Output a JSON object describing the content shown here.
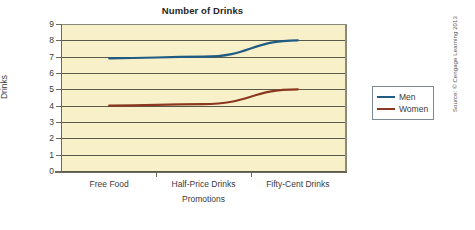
{
  "chart_data": {
    "type": "line",
    "title": "Number of Drinks",
    "xlabel": "Promotions",
    "ylabel": "Drinks",
    "categories": [
      "Free Food",
      "Half-Price Drinks",
      "Fifty-Cent Drinks"
    ],
    "series": [
      {
        "name": "Men",
        "values": [
          6.9,
          7.0,
          8.0
        ],
        "color": "#1f5b82"
      },
      {
        "name": "Women",
        "values": [
          4.0,
          4.1,
          5.0
        ],
        "color": "#8c3820"
      }
    ],
    "ylim": [
      0,
      9
    ],
    "yticks": [
      "0",
      "1",
      "2",
      "3",
      "4",
      "5",
      "6",
      "7",
      "8",
      "9"
    ],
    "grid": "horizontal",
    "legend_position": "right",
    "plot_background": "#f7f0c9",
    "gridline_color": "#5a5a4a"
  },
  "legend": {
    "entries": [
      {
        "label": "Men"
      },
      {
        "label": "Women"
      }
    ]
  },
  "credit": {
    "text": "Source: © Cengage Learning 2013"
  }
}
